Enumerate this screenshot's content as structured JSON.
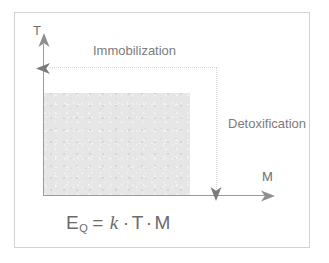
{
  "figure": {
    "axes": {
      "vertical": {
        "label": "T",
        "name": "T-axis"
      },
      "horizontal": {
        "label": "M",
        "name": "M-axis"
      }
    },
    "annotations": [
      {
        "id": "immobilization",
        "label": "Immobilization",
        "direction": "left"
      },
      {
        "id": "detoxification",
        "label": "Detoxification",
        "direction": "down"
      }
    ],
    "formula": {
      "lhs_symbol": "E",
      "lhs_subscript": "Q",
      "equals": "=",
      "coefficient": "k",
      "operator1": "·",
      "factor1": "T",
      "operator2": "·",
      "factor2": "M",
      "plain_text": "E_Q = k·T·M"
    },
    "region": {
      "name": "shaded-area",
      "fill_color": "#e4e4e4"
    },
    "colors": {
      "frame": "#d2d2d2",
      "axis": "#9a9a9a",
      "dotted": "#d6d6d6",
      "text": "#6e6e6e",
      "shade": "#e4e4e4",
      "background": "#ffffff"
    }
  }
}
